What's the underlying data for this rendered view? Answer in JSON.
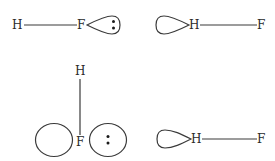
{
  "diagram": {
    "title": "",
    "panels": [
      {
        "id": "top-left",
        "atoms": [
          {
            "label": "H"
          },
          {
            "label": "F"
          }
        ],
        "bond": "H–F horizontal",
        "orbital": {
          "type": "lone-pair-lobe",
          "on": "F",
          "electrons": 2
        }
      },
      {
        "id": "top-right",
        "atoms": [
          {
            "label": "H"
          },
          {
            "label": "F"
          }
        ],
        "bond": "H–F horizontal",
        "orbital": {
          "type": "empty-lobe",
          "on": "H",
          "electrons": 0
        }
      },
      {
        "id": "bottom-left",
        "atoms": [
          {
            "label": "H"
          },
          {
            "label": "F"
          }
        ],
        "bond": "H–F vertical",
        "orbitals": [
          {
            "type": "empty-p-lobe",
            "side": "left",
            "electrons": 0
          },
          {
            "type": "lone-pair-p-lobe",
            "side": "right",
            "electrons": 2
          }
        ]
      },
      {
        "id": "bottom-right",
        "atoms": [
          {
            "label": "H"
          },
          {
            "label": "F"
          }
        ],
        "bond": "H–F horizontal",
        "orbital": {
          "type": "empty-lobe",
          "on": "H",
          "electrons": 0
        }
      }
    ],
    "labels": {
      "tl_h": "H",
      "tl_f": "F",
      "tr_h": "H",
      "tr_f": "F",
      "bl_h": "H",
      "bl_f": "F",
      "br_h": "H",
      "br_f": "F"
    }
  }
}
